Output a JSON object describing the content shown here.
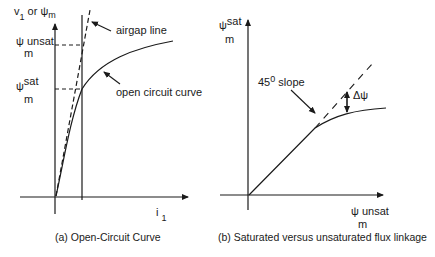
{
  "panel_a": {
    "y_axis_label_v": "v",
    "y_axis_label_sub1": "1",
    "y_axis_label_or": "or",
    "y_axis_label_psi": "ψ",
    "y_axis_label_sub_m": "m",
    "x_axis_label": "i",
    "x_axis_label_sub": "1",
    "tick_unsat_psi": "ψ",
    "tick_unsat_sup": "unsat",
    "tick_unsat_sub": "m",
    "tick_sat_psi": "ψ",
    "tick_sat_sup": "sat",
    "tick_sat_sub": "m",
    "annotation_airgap": "airgap line",
    "annotation_occ": "open circuit curve",
    "caption": "(a) Open-Circuit Curve"
  },
  "panel_b": {
    "y_axis_psi": "ψ",
    "y_axis_sup": "sat",
    "y_axis_sub": "m",
    "x_axis_psi": "ψ",
    "x_axis_sup": "unsat",
    "x_axis_sub": "m",
    "annotation_slope_num": "45",
    "annotation_slope_sup": "0",
    "annotation_slope_text": "slope",
    "annotation_delta": "Δψ",
    "caption": "(b)  Saturated versus unsaturated flux linkage"
  }
}
